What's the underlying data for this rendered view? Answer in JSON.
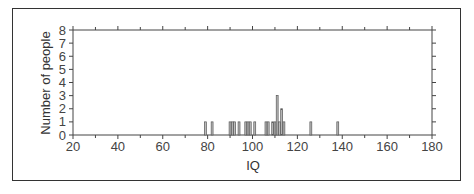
{
  "chart_data": {
    "type": "bar",
    "title": "",
    "xlabel": "IQ",
    "ylabel": "Number of people",
    "xlim": [
      20,
      180
    ],
    "ylim": [
      0,
      8
    ],
    "x_ticks": [
      20,
      40,
      60,
      80,
      100,
      120,
      140,
      160,
      180
    ],
    "y_ticks": [
      0,
      1,
      2,
      3,
      4,
      5,
      6,
      7,
      8
    ],
    "grid": false,
    "legend": null,
    "x": [
      79,
      82,
      90,
      91,
      92,
      94,
      97,
      98,
      99,
      101,
      106,
      107,
      109,
      110,
      111,
      112,
      113,
      114,
      126,
      138
    ],
    "values": [
      1,
      1,
      1,
      1,
      1,
      1,
      1,
      1,
      1,
      1,
      1,
      1,
      1,
      1,
      3,
      1,
      2,
      1,
      1,
      1
    ]
  },
  "colors": {
    "bar_fill": "#bdbdbd",
    "bar_stroke": "#555555",
    "axis": "#444444",
    "frame": "#333333"
  }
}
